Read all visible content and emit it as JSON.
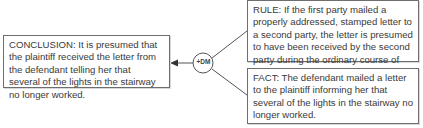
{
  "diagram": {
    "conclusion": {
      "text": "CONCLUSION: It is presumed that the plaintiff received the letter from the defendant telling her that several of the lights in the stairway no longer worked."
    },
    "rule": {
      "text": "RULE: If the first party mailed a properly addressed, stamped letter to a second party, the letter is presumed to have been received by the second party during the ordinary course of the mail."
    },
    "fact": {
      "text": "FACT: The defendant mailed a letter to the plaintiff informing her that several of the lights in the stairway no longer worked."
    },
    "connector_node": {
      "label": "+DM"
    },
    "colors": {
      "border": "#6e6e6e",
      "line": "#555555",
      "text": "#3a3a3a"
    }
  }
}
